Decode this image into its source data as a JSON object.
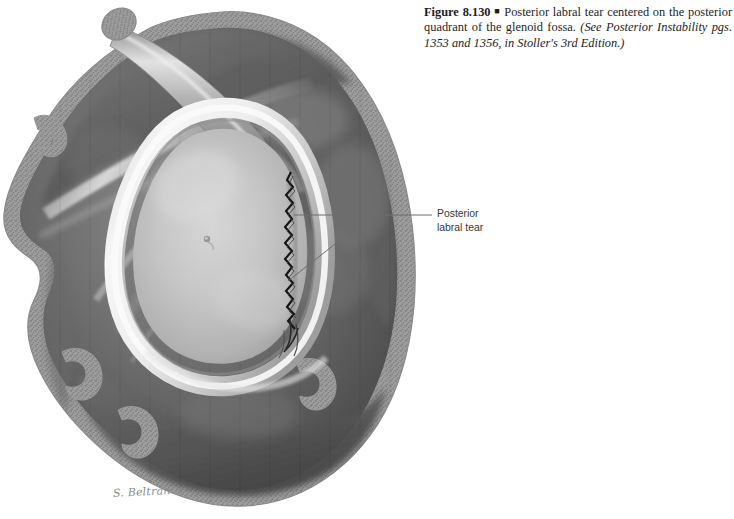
{
  "figure": {
    "number_label": "Figure 8.130",
    "bullet": "■",
    "text_main": "Posterior labral tear centered on the posterior quadrant of the glenoid fossa.",
    "text_reference": "(See Posterior Instability pgs. 1353 and 1356, in Stoller's 3rd Edition.)",
    "full_caption": "Figure 8.130 ■ Posterior labral tear centered on the posterior quadrant of the glenoid fossa. (See Posterior Instability pgs. 1353 and 1356, in Stoller's 3rd Edition.)"
  },
  "annotations": [
    {
      "name": "posterior-labral-tear",
      "line1": "Posterior",
      "line2": "labral tear"
    }
  ],
  "credit": {
    "artist": "S. Beltrán"
  },
  "illustration": {
    "title": "glenoid-fossa-en-face-view",
    "structures": [
      "scapula-body",
      "glenoid-fossa-articular-surface",
      "glenoid-labrum",
      "posterior-labral-tear",
      "biceps-tendon-long-head",
      "cut-bone-cancellous-edge"
    ]
  },
  "colors": {
    "background": "#ffffff",
    "caption_text": "#1d1d1d",
    "label_text": "#363636",
    "leader_line": "#6e6e6e",
    "signature": "#8c8c8c",
    "bone_cut_edge": "#9a9a9a",
    "soft_tissue_dark": "#4c4c4c",
    "soft_tissue_mid": "#7b7b7b",
    "glenoid_surface": "#c3c3c3",
    "labrum_highlight": "#f2f2f2",
    "tear_line": "#1a1a1a"
  }
}
